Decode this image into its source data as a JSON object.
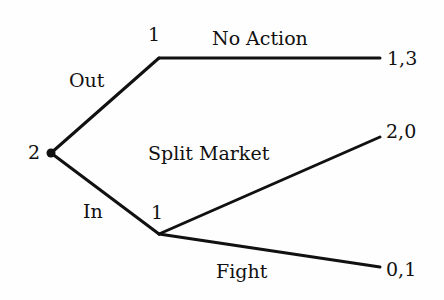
{
  "diagram": {
    "type": "game-tree",
    "colors": {
      "ink": "#111111",
      "background": "#fefefe"
    },
    "nodes": [
      {
        "id": "root",
        "player": "2",
        "x": 51,
        "y": 153
      },
      {
        "id": "n_out",
        "player": "1",
        "x": 159,
        "y": 58
      },
      {
        "id": "n_in",
        "player": "1",
        "x": 159,
        "y": 234
      }
    ],
    "edges": [
      {
        "from": "root",
        "to": "n_out",
        "label": "Out"
      },
      {
        "from": "root",
        "to": "n_in",
        "label": "In"
      },
      {
        "from": "n_out",
        "to": "t_noaction",
        "label": "No Action"
      },
      {
        "from": "n_in",
        "to": "t_split",
        "label": "Split Market"
      },
      {
        "from": "n_in",
        "to": "t_fight",
        "label": "Fight"
      }
    ],
    "payoffs": [
      {
        "id": "t_noaction",
        "value": "1,3"
      },
      {
        "id": "t_split",
        "value": "2,0"
      },
      {
        "id": "t_fight",
        "value": "0,1"
      }
    ]
  }
}
